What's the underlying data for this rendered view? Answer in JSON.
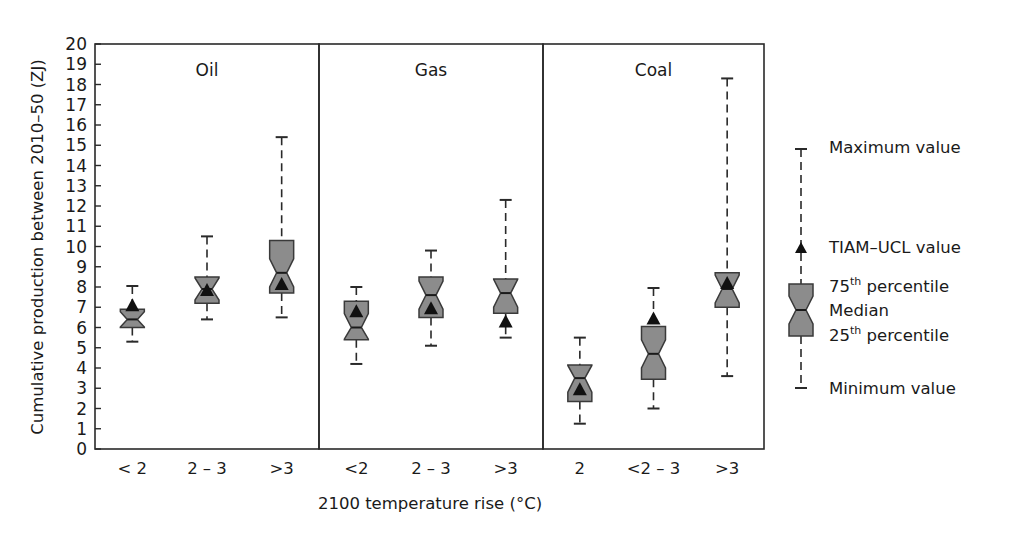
{
  "chart_data": {
    "type": "boxplot",
    "title": "",
    "xlabel": "2100 temperature rise (°C)",
    "ylabel": "Cumulative production between 2010–50 (ZJ)",
    "ylim": [
      0,
      20
    ],
    "yticks": [
      0,
      1,
      2,
      3,
      4,
      5,
      6,
      7,
      8,
      9,
      10,
      11,
      12,
      13,
      14,
      15,
      16,
      17,
      18,
      19,
      20
    ],
    "grid": false,
    "box_color": "#8c8c8c",
    "marker": "triangle",
    "legend_position": "right",
    "panels": [
      {
        "title": "Oil",
        "categories": [
          "< 2",
          "2 – 3",
          ">3"
        ],
        "boxes": [
          {
            "min": 5.3,
            "q1": 6.0,
            "median": 6.4,
            "q3": 6.9,
            "max": 8.05,
            "tiam_ucl": 7.1
          },
          {
            "min": 6.4,
            "q1": 7.2,
            "median": 7.9,
            "q3": 8.5,
            "max": 10.5,
            "tiam_ucl": 7.85
          },
          {
            "min": 6.5,
            "q1": 7.7,
            "median": 8.7,
            "q3": 10.3,
            "max": 15.4,
            "tiam_ucl": 8.15
          }
        ]
      },
      {
        "title": "Gas",
        "categories": [
          "<2",
          "2 – 3",
          ">3"
        ],
        "boxes": [
          {
            "min": 4.2,
            "q1": 5.4,
            "median": 6.0,
            "q3": 7.3,
            "max": 8.0,
            "tiam_ucl": 6.8
          },
          {
            "min": 5.1,
            "q1": 6.5,
            "median": 7.6,
            "q3": 8.5,
            "max": 9.8,
            "tiam_ucl": 6.95
          },
          {
            "min": 5.5,
            "q1": 6.7,
            "median": 7.7,
            "q3": 8.4,
            "max": 12.3,
            "tiam_ucl": 6.3
          }
        ]
      },
      {
        "title": "Coal",
        "categories": [
          "2",
          "<2 – 3",
          ">3"
        ],
        "boxes": [
          {
            "min": 1.25,
            "q1": 2.35,
            "median": 3.5,
            "q3": 4.15,
            "max": 5.5,
            "tiam_ucl": 2.95
          },
          {
            "min": 2.0,
            "q1": 3.45,
            "median": 4.7,
            "q3": 6.05,
            "max": 7.95,
            "tiam_ucl": 6.45
          },
          {
            "min": 3.6,
            "q1": 7.0,
            "median": 7.9,
            "q3": 8.7,
            "max": 18.3,
            "tiam_ucl": 8.2
          }
        ]
      }
    ],
    "legend": {
      "max": "Maximum value",
      "tiam": "TIAM–UCL value",
      "q3_num": "75",
      "q3_sup": "th",
      "q3_rest": " percentile",
      "median": "Median",
      "q1_num": "25",
      "q1_sup": "th",
      "q1_rest": " percentile",
      "min": "Minimum value"
    }
  }
}
